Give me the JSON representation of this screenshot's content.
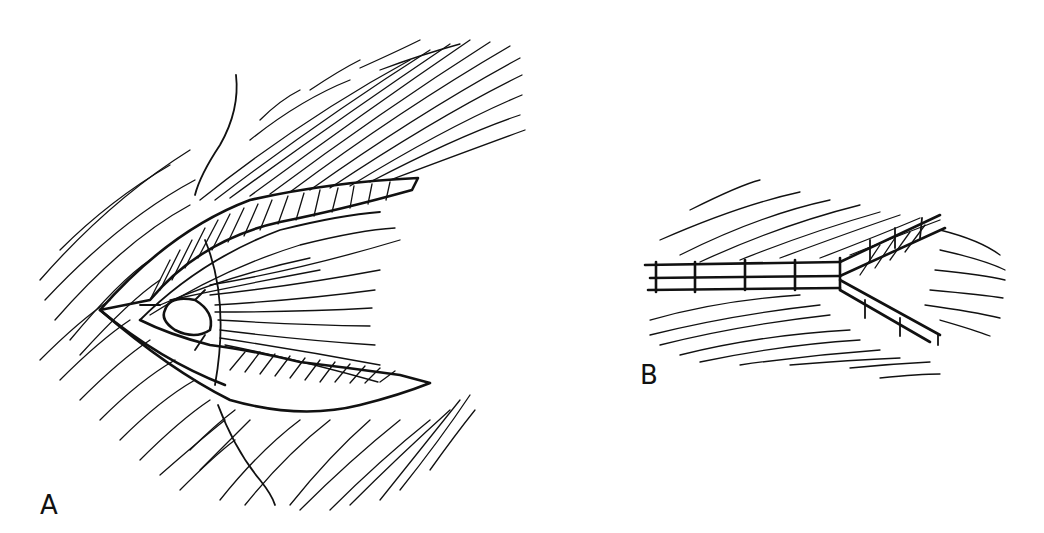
{
  "figure": {
    "panels": [
      {
        "id": "A",
        "label": "A",
        "description": "Open wound with exposed tissue layers and a suture thread passing through the flaps"
      },
      {
        "id": "B",
        "label": "B",
        "description": "Closed wound with interrupted sutures along a Y-shaped incision"
      }
    ],
    "colors": {
      "ink": "#111111",
      "background": "#ffffff"
    }
  }
}
